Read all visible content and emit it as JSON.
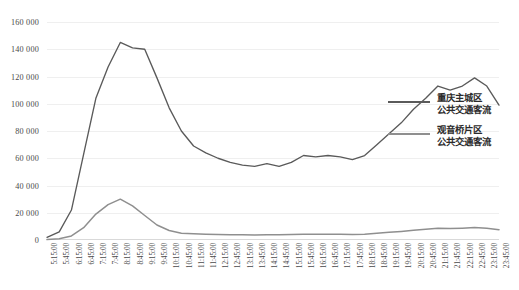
{
  "chart_data": {
    "type": "line",
    "title": "",
    "xlabel": "",
    "ylabel": "",
    "ylim": [
      0,
      160000
    ],
    "ytick_step": 20000,
    "grid": true,
    "legend_position": "right",
    "ytick_labels": [
      "0",
      "20 000",
      "40 000",
      "60 000",
      "80 000",
      "100 000",
      "120 000",
      "140 000",
      "160 000"
    ],
    "ytick_values": [
      0,
      20000,
      40000,
      60000,
      80000,
      100000,
      120000,
      140000,
      160000
    ],
    "categories": [
      "5:15:00",
      "5:45:00",
      "6:15:00",
      "6:45:00",
      "7:15:00",
      "7:45:00",
      "8:15:00",
      "8:45:00",
      "9:15:00",
      "9:45:00",
      "10:15:00",
      "10:45:00",
      "11:15:00",
      "11:45:00",
      "12:15:00",
      "12:45:00",
      "13:15:00",
      "13:45:00",
      "14:15:00",
      "14:45:00",
      "15:15:00",
      "15:45:00",
      "16:15:00",
      "16:45:00",
      "17:15:00",
      "17:45:00",
      "18:15:00",
      "18:45:00",
      "19:15:00",
      "19:45:00",
      "20:15:00",
      "20:45:00",
      "21:15:00",
      "21:45:00",
      "22:15:00",
      "22:45:00",
      "23:15:00",
      "23:45:00"
    ],
    "series": [
      {
        "name": "重庆主城区\n公共交通客流",
        "color": "#5a5a5a",
        "values": [
          2000,
          6000,
          22000,
          63000,
          104000,
          127000,
          145000,
          141000,
          140000,
          119000,
          97000,
          80000,
          69000,
          64000,
          60000,
          57000,
          55000,
          54000,
          56000,
          54000,
          57000,
          62000,
          61000,
          62000,
          61000,
          59000,
          62000,
          70000,
          78000,
          86000,
          96000,
          104000,
          113000,
          110000,
          113000,
          119000,
          113000,
          99000
        ]
      },
      {
        "name": "观音桥片区\n公共交通客流",
        "color": "#8f8f8f",
        "values": [
          300,
          900,
          3000,
          9000,
          19000,
          26000,
          30000,
          25000,
          18000,
          11000,
          7000,
          5000,
          4500,
          4200,
          4000,
          3900,
          3800,
          3700,
          3900,
          3800,
          4000,
          4200,
          4200,
          4300,
          4200,
          4100,
          4300,
          5000,
          5600,
          6300,
          7100,
          7900,
          8700,
          8400,
          8700,
          9200,
          8700,
          7600
        ]
      }
    ],
    "series_extended_note": ""
  },
  "legend": {
    "entries": [
      {
        "label": "重庆主城区\n公共交通客流",
        "color": "#5a5a5a"
      },
      {
        "label": "观音桥片区\n公共交通客流",
        "color": "#8f8f8f"
      }
    ]
  },
  "colors": {
    "series_primary": "#5a5a5a",
    "series_secondary": "#8f8f8f",
    "gridline": "#efefef",
    "axis": "#d9d9d9",
    "text": "#4a4a4a",
    "background": "#ffffff"
  }
}
